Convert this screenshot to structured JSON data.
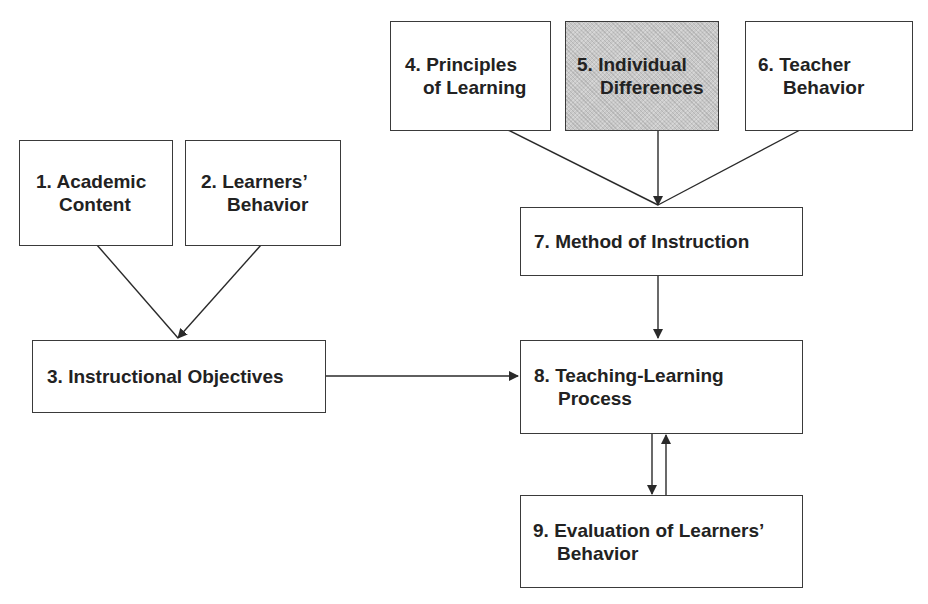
{
  "diagram": {
    "boxes": [
      {
        "id": 1,
        "number": "1.",
        "line1": "Academic",
        "line2": "Content"
      },
      {
        "id": 2,
        "number": "2.",
        "line1": "Learners’",
        "line2": "Behavior"
      },
      {
        "id": 3,
        "number": "3.",
        "line1": "Instructional Objectives",
        "line2": ""
      },
      {
        "id": 4,
        "number": "4.",
        "line1": "Principles",
        "line2": "of Learning"
      },
      {
        "id": 5,
        "number": "5.",
        "line1": "Individual",
        "line2": "Differences",
        "shaded": true
      },
      {
        "id": 6,
        "number": "6.",
        "line1": "Teacher",
        "line2": "Behavior"
      },
      {
        "id": 7,
        "number": "7.",
        "line1": "Method of Instruction",
        "line2": ""
      },
      {
        "id": 8,
        "number": "8.",
        "line1": "Teaching-Learning",
        "line2": "Process"
      },
      {
        "id": 9,
        "number": "9.",
        "line1": "Evaluation of Learners’",
        "line2": "Behavior"
      }
    ],
    "connections": [
      {
        "from": 1,
        "to": 3
      },
      {
        "from": 2,
        "to": 3
      },
      {
        "from": 4,
        "to": 7
      },
      {
        "from": 5,
        "to": 7
      },
      {
        "from": 6,
        "to": 7
      },
      {
        "from": 3,
        "to": 8
      },
      {
        "from": 7,
        "to": 8
      },
      {
        "from": 8,
        "to": 9
      },
      {
        "from": 9,
        "to": 8
      }
    ],
    "colors": {
      "line": "#2a2a2a",
      "box_border": "#3a3a3a",
      "shaded_fill": "#c9c9c9",
      "text": "#222222"
    }
  }
}
